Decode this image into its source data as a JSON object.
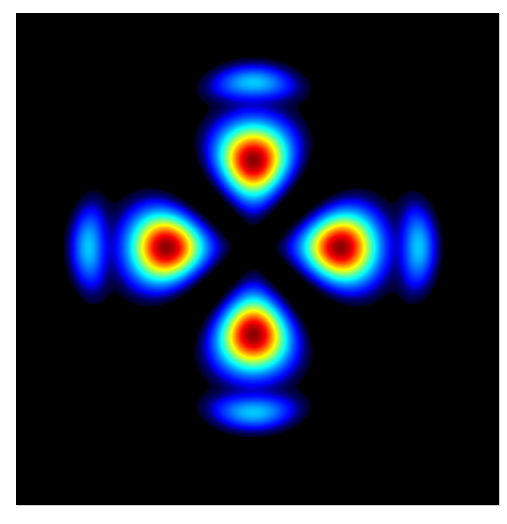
{
  "image": {
    "description": "Four-lobe optical mode intensity pattern (jet colormap) on black background",
    "alt_text": "Intensity distribution with four red-cored lobes arranged top, bottom, left and right, with faint blue outer arcs",
    "colormap": "jet",
    "background_color": "#000000",
    "page_background": "#ffffff",
    "frame": {
      "x": 16,
      "y": 13,
      "width": 483,
      "height": 492
    },
    "center": {
      "x": 253,
      "y": 247
    },
    "lobes": [
      {
        "name": "top",
        "cx": 253,
        "cy": 160,
        "peak": 1.0
      },
      {
        "name": "bottom",
        "cx": 253,
        "cy": 332,
        "peak": 1.0
      },
      {
        "name": "left",
        "cx": 167,
        "cy": 245,
        "peak": 1.0
      },
      {
        "name": "right",
        "cx": 337,
        "cy": 245,
        "peak": 1.0
      }
    ],
    "outer_arcs": [
      {
        "name": "top",
        "cx": 253,
        "cy": 85,
        "peak": 0.22
      },
      {
        "name": "bottom",
        "cx": 253,
        "cy": 413,
        "peak": 0.22
      },
      {
        "name": "left",
        "cx": 88,
        "cy": 245,
        "peak": 0.22
      },
      {
        "name": "right",
        "cx": 416,
        "cy": 245,
        "peak": 0.22
      }
    ],
    "colors": {
      "peak_dark_red": "#7a0000",
      "red": "#e01000",
      "yellow": "#f0f000",
      "cyan_green": "#40c0a0",
      "light_blue": "#2090e0",
      "blue": "#0030c0",
      "dark_blue": "#000060"
    }
  }
}
